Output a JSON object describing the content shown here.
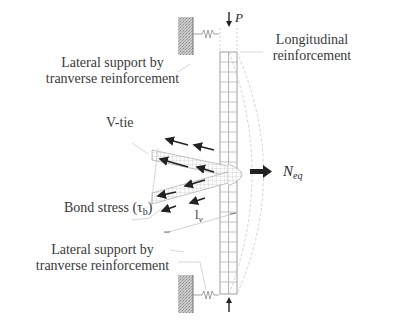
{
  "diagram": {
    "labels": {
      "lateral_support_top": [
        "Lateral support by",
        "tranverse reinforcement"
      ],
      "longitudinal": [
        "Longitudinal",
        "reinforcement"
      ],
      "v_tie": "V-tie",
      "bond_stress": "Bond stress (τ",
      "bond_stress_sub": "b",
      "bond_stress_close": ")",
      "lv": "l",
      "lv_sub": "v",
      "neq": "N",
      "neq_sub": "eq",
      "p": "P",
      "lateral_support_bottom": [
        "Lateral support by",
        "tranverse reinforcement"
      ]
    },
    "icons": {
      "top_wall": "hatched-wall-support",
      "bottom_wall": "hatched-wall-support",
      "top_spring": "spring-icon",
      "bottom_spring": "spring-icon",
      "load_top": "arrow-down-icon",
      "load_bottom": "arrow-up-icon",
      "neq_arrow": "arrow-right-icon"
    },
    "colors": {
      "text": "#3a3a3a",
      "line": "#555555",
      "light_line": "#b8b8b8",
      "hatch": "#a8a8a8",
      "arrow": "#222222"
    }
  }
}
